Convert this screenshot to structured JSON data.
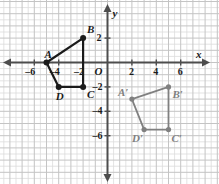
{
  "figure": {
    "axis_labels": {
      "x": "x",
      "y": "y",
      "origin": "O"
    },
    "x_ticks": [
      {
        "value": -6,
        "label": "–6"
      },
      {
        "value": -4,
        "label": "–4"
      },
      {
        "value": -2,
        "label": "–2"
      },
      {
        "value": 2,
        "label": "2"
      },
      {
        "value": 4,
        "label": "4"
      },
      {
        "value": 6,
        "label": "6"
      }
    ],
    "y_ticks": [
      {
        "value": 2,
        "label": "2"
      },
      {
        "value": -2,
        "label": "–2"
      },
      {
        "value": -4,
        "label": "–4"
      },
      {
        "value": -6,
        "label": "–6"
      }
    ],
    "colors": {
      "preimage": "#1a1a1a",
      "image": "#808080",
      "axis": "#4d4d4d",
      "grid_minor": "#dcdcdc",
      "grid_major": "#c4c4c4",
      "background": "#ffffff"
    }
  },
  "chart_data": {
    "type": "scatter",
    "title": "",
    "xlabel": "x",
    "ylabel": "y",
    "xlim": [
      -7.5,
      7
    ],
    "ylim": [
      -7,
      3.2
    ],
    "grid": true,
    "legend": "none",
    "series": [
      {
        "name": "ABCD",
        "role": "preimage",
        "color": "#1a1a1a",
        "closed": true,
        "points": [
          {
            "label": "A",
            "x": -5,
            "y": 0,
            "label_dx": -2,
            "label_dy": -14
          },
          {
            "label": "B",
            "x": -2,
            "y": 2,
            "label_dx": 4,
            "label_dy": -14
          },
          {
            "label": "C",
            "x": -2,
            "y": -2,
            "label_dx": 4,
            "label_dy": 2
          },
          {
            "label": "D",
            "x": -4,
            "y": -2,
            "label_dx": -3,
            "label_dy": 4
          }
        ]
      },
      {
        "name": "A'B'C'D'",
        "role": "image",
        "color": "#808080",
        "closed": true,
        "points": [
          {
            "label": "A′",
            "x": 2,
            "y": -3,
            "label_dx": -14,
            "label_dy": -12
          },
          {
            "label": "B′",
            "x": 5,
            "y": -2,
            "label_dx": 4,
            "label_dy": 2
          },
          {
            "label": "C′",
            "x": 5,
            "y": -5.5,
            "label_dx": 3,
            "label_dy": 3
          },
          {
            "label": "D′",
            "x": 3,
            "y": -5.5,
            "label_dx": -12,
            "label_dy": 3
          }
        ]
      }
    ]
  }
}
